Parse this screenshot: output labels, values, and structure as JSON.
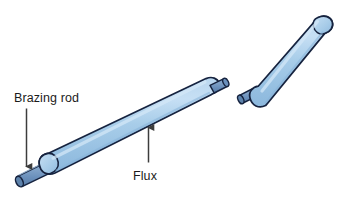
{
  "diagram": {
    "background_color": "#ffffff"
  },
  "labels": {
    "brazing_rod": "Brazing rod",
    "flux": "Flux"
  },
  "colors": {
    "flux_coating": "#a3c8e8",
    "flux_coating_highlight": "#c2dcf2",
    "flux_coating_shadow": "#8fb9de",
    "rod_core": "#6e93bd",
    "rod_core_shadow": "#5a7ea8",
    "rod_core_highlight": "#85a6ca",
    "outline": "#16233f",
    "arrow": "#3d3d3d",
    "text": "#1b1b1b"
  },
  "parts": [
    {
      "name": "lower-left-rod-segment",
      "description": "Flux coated brazing rod segment, lower left, broken at upper right end"
    },
    {
      "name": "upper-right-rod-segment",
      "description": "Flux coated brazing rod segment, upper right, broken at lower left end"
    },
    {
      "name": "exposed-rod-tip",
      "description": "Bare brazing rod core protruding from the flux coating at the far lower left end"
    },
    {
      "name": "break-stub-left",
      "description": "Bare rod core exposed at the fracture on the left segment"
    },
    {
      "name": "break-stub-right",
      "description": "Bare rod core exposed at the fracture on the right segment"
    }
  ],
  "annotations": [
    {
      "name": "brazing-rod-annotation",
      "label": "Brazing rod",
      "points_to": "exposed-rod-tip",
      "arrow_direction": "down"
    },
    {
      "name": "flux-annotation",
      "label": "Flux",
      "points_to": "lower-left-rod-segment",
      "arrow_direction": "up"
    }
  ]
}
